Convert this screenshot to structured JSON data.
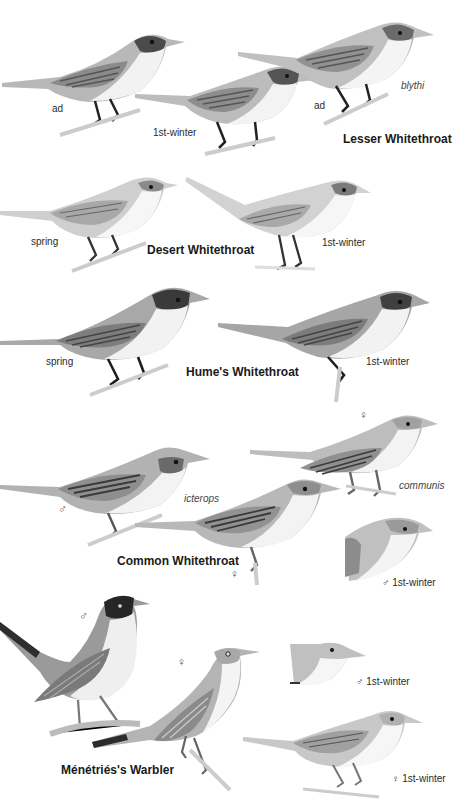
{
  "plate": {
    "species": [
      {
        "name": "Lesser Whitethroat",
        "labels": [
          "ad",
          "1st-winter",
          "ad",
          "blythi"
        ]
      },
      {
        "name": "Desert Whitethroat",
        "labels": [
          "spring",
          "1st-winter"
        ]
      },
      {
        "name": "Hume's Whitethroat",
        "labels": [
          "spring",
          "1st-winter"
        ]
      },
      {
        "name": "Common Whitethroat",
        "labels": [
          "♂",
          "icterops",
          "♀",
          "♀",
          "communis",
          "♂ 1st-winter"
        ]
      },
      {
        "name": "Ménétriés's Warbler",
        "labels": [
          "♂",
          "♀",
          "♂ 1st-winter",
          "♀ 1st-winter"
        ]
      }
    ]
  }
}
